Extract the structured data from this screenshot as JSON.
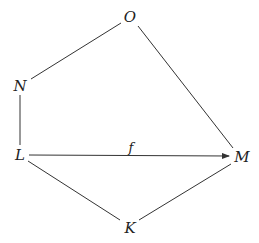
{
  "diagram": {
    "type": "graph",
    "nodes": [
      {
        "id": "O",
        "label": "O",
        "x": 130,
        "y": 17
      },
      {
        "id": "N",
        "label": "N",
        "x": 20,
        "y": 86
      },
      {
        "id": "L",
        "label": "L",
        "x": 20,
        "y": 155
      },
      {
        "id": "M",
        "label": "M",
        "x": 241,
        "y": 157
      },
      {
        "id": "K",
        "label": "K",
        "x": 130,
        "y": 228
      }
    ],
    "edges": [
      {
        "from": "O",
        "to": "N",
        "directed": false,
        "label": ""
      },
      {
        "from": "O",
        "to": "M",
        "directed": false,
        "label": ""
      },
      {
        "from": "N",
        "to": "L",
        "directed": false,
        "label": ""
      },
      {
        "from": "L",
        "to": "M",
        "directed": true,
        "label": "f"
      },
      {
        "from": "L",
        "to": "K",
        "directed": false,
        "label": ""
      },
      {
        "from": "K",
        "to": "M",
        "directed": false,
        "label": ""
      }
    ],
    "edge_label_f": "f",
    "line_color": "#333333"
  }
}
